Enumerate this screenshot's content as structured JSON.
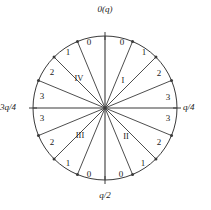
{
  "figure": {
    "title": "",
    "geometry": {
      "center_x": 105,
      "center_y": 108,
      "radius": 72,
      "sector_count": 16,
      "stroke_color": "#3a3a3a",
      "text_color": "#1a1a1a",
      "background": "#ffffff"
    },
    "axis_labels": [
      {
        "name": "top",
        "text": "0(q)",
        "angle_deg": 90
      },
      {
        "name": "right",
        "text": "q/4",
        "angle_deg": 0
      },
      {
        "name": "bottom",
        "text": "q/2",
        "angle_deg": 270
      },
      {
        "name": "left",
        "text": "3q/4",
        "angle_deg": 180
      }
    ],
    "quadrants": [
      {
        "name": "quadrant-1",
        "label": "I",
        "label_x": 123,
        "label_y": 80
      },
      {
        "name": "quadrant-2",
        "label": "II",
        "label_x": 126,
        "label_y": 136
      },
      {
        "name": "quadrant-3",
        "label": "III",
        "label_x": 80,
        "label_y": 135
      },
      {
        "name": "quadrant-4",
        "label": "IV",
        "label_x": 79,
        "label_y": 78
      }
    ],
    "sectors": [
      {
        "name": "sector-q1-0",
        "label": "0",
        "x": 122,
        "y": 42
      },
      {
        "name": "sector-q1-1",
        "label": "1",
        "x": 144,
        "y": 52
      },
      {
        "name": "sector-q1-2",
        "label": "2",
        "x": 159,
        "y": 73
      },
      {
        "name": "sector-q1-3",
        "label": "3",
        "x": 168,
        "y": 97
      },
      {
        "name": "sector-q2-3",
        "label": "3",
        "x": 168,
        "y": 118
      },
      {
        "name": "sector-q2-2",
        "label": "2",
        "x": 159,
        "y": 142
      },
      {
        "name": "sector-q2-1",
        "label": "1",
        "x": 143,
        "y": 163
      },
      {
        "name": "sector-q2-0",
        "label": "0",
        "x": 121,
        "y": 174
      },
      {
        "name": "sector-q3-0",
        "label": "0",
        "x": 89,
        "y": 174
      },
      {
        "name": "sector-q3-1",
        "label": "1",
        "x": 68,
        "y": 163
      },
      {
        "name": "sector-q3-2",
        "label": "2",
        "x": 52,
        "y": 142
      },
      {
        "name": "sector-q3-3",
        "label": "3",
        "x": 42,
        "y": 118
      },
      {
        "name": "sector-q4-3",
        "label": "3",
        "x": 42,
        "y": 96
      },
      {
        "name": "sector-q4-2",
        "label": "2",
        "x": 52,
        "y": 72
      },
      {
        "name": "sector-q4-1",
        "label": "1",
        "x": 68,
        "y": 52
      },
      {
        "name": "sector-q4-0",
        "label": "0",
        "x": 89,
        "y": 42
      }
    ]
  }
}
